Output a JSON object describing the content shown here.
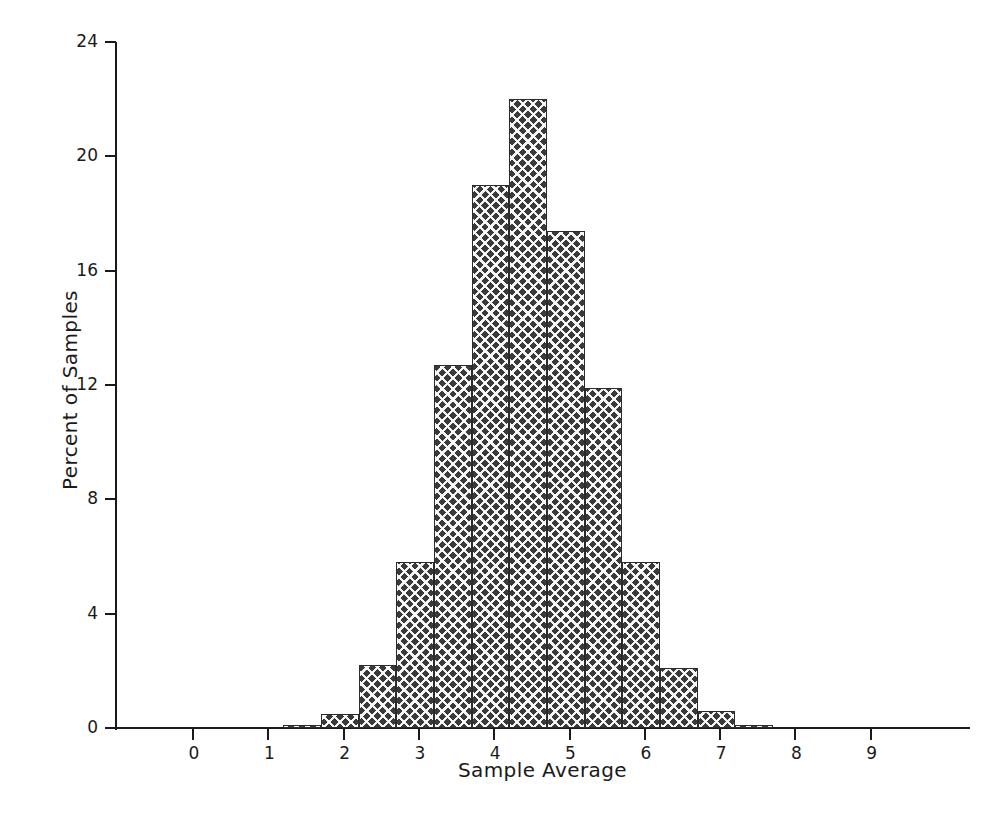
{
  "chart_data": {
    "type": "bar",
    "title": "",
    "subtitle": "",
    "xlabel": "Sample Average",
    "ylabel": "Percent of Samples",
    "xlim": [
      -0.7,
      10.3
    ],
    "ylim": [
      0,
      24
    ],
    "grid": false,
    "legend": null,
    "bin_width": 0.5,
    "bin_starts": [
      1.2,
      1.7,
      2.2,
      2.7,
      3.2,
      3.7,
      4.2,
      4.7,
      5.2,
      5.7,
      6.2,
      6.7,
      7.2
    ],
    "bin_ends": [
      1.7,
      2.2,
      2.7,
      3.2,
      3.7,
      4.2,
      4.7,
      5.2,
      5.7,
      6.2,
      6.7,
      7.2,
      7.7
    ],
    "categories": [
      "1.2-1.7",
      "1.7-2.2",
      "2.2-2.7",
      "2.7-3.2",
      "3.2-3.7",
      "3.7-4.2",
      "4.2-4.7",
      "4.7-5.2",
      "5.2-5.7",
      "5.7-6.2",
      "6.2-6.7",
      "6.7-7.2",
      "7.2-7.7"
    ],
    "values": [
      0.1,
      0.5,
      2.2,
      5.8,
      12.7,
      19.0,
      22.0,
      17.4,
      11.9,
      5.8,
      2.1,
      0.6,
      0.1
    ],
    "xticks": [
      0,
      1,
      2,
      3,
      4,
      5,
      6,
      7,
      8,
      9
    ],
    "xtick_labels": [
      "0",
      "1",
      "2",
      "3",
      "4",
      "5",
      "6",
      "7",
      "8",
      "9"
    ],
    "yticks": [
      0,
      4,
      8,
      12,
      16,
      20,
      24
    ],
    "ytick_labels": [
      "0",
      "4",
      "8",
      "12",
      "16",
      "20",
      "24"
    ],
    "bar_fill": "#3a3a3a",
    "bar_edge": "#2b2b2b",
    "axis_color": "#1a1a1a",
    "background": "#ffffff"
  }
}
